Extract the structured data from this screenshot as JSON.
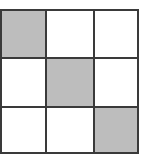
{
  "grid": {
    "rows": 3,
    "cols": 3,
    "cells": [
      [
        {
          "shaded": true
        },
        {
          "shaded": false
        },
        {
          "shaded": false
        }
      ],
      [
        {
          "shaded": false
        },
        {
          "shaded": true
        },
        {
          "shaded": false
        }
      ],
      [
        {
          "shaded": false
        },
        {
          "shaded": false
        },
        {
          "shaded": true
        }
      ]
    ],
    "colors": {
      "shaded": "#bdbdbd",
      "empty": "#ffffff",
      "line": "#3a3a3a"
    }
  }
}
